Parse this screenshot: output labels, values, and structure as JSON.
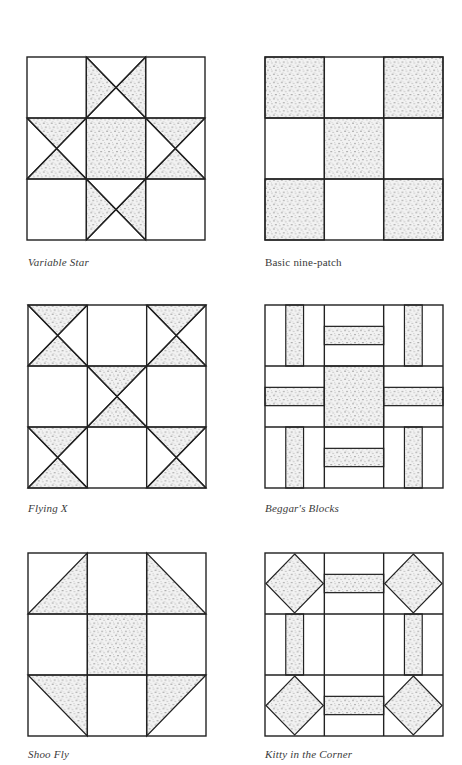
{
  "page": {
    "type": "quilt-block-reference-page",
    "colors": {
      "line": "#222222",
      "stipple_base": "#f2f2f2",
      "stipple_dot": "#555555",
      "background": "#ffffff"
    }
  },
  "blocks": [
    {
      "id": "variable-star",
      "label": "Variable Star",
      "italic": true,
      "grid": "3x3",
      "shaded": "center square; hourglass triangles (shaded top/bottom halves) in top-center and bottom-center cells; shaded left/right triangles in middle-left and middle-right cells"
    },
    {
      "id": "basic-nine-patch",
      "label": "Basic nine-patch",
      "italic": false,
      "grid": "3x3",
      "shaded": "four corner squares and center square"
    },
    {
      "id": "flying-x",
      "label": "Flying X",
      "italic": true,
      "grid": "3x3",
      "shaded": "hourglass (top/bottom triangles) in four corners and center cell"
    },
    {
      "id": "beggars-blocks",
      "label": "Beggar's Blocks",
      "italic": true,
      "grid": "3x3",
      "shaded": "center square; vertical center strips in corner cells; horizontal center strips in edge cells"
    },
    {
      "id": "shoo-fly",
      "label": "Shoo Fly",
      "italic": true,
      "grid": "3x3",
      "shaded": "center square; inward-facing half-square triangles in four corners"
    },
    {
      "id": "kitty-in-the-corner",
      "label": "Kitty in the Corner",
      "italic": true,
      "grid": "3x3",
      "shaded": "diamonds (square-in-square) in four corners; center strips in edge cells; plain center"
    }
  ]
}
